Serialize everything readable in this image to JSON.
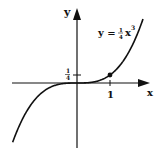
{
  "chart_data": {
    "type": "line",
    "title": "",
    "function": "y = 1/4 x^3",
    "equation_label": {
      "lhs": "y =",
      "frac_num": "1",
      "frac_den": "4",
      "var": "x",
      "exp": "3"
    },
    "xlabel": "x",
    "ylabel": "y",
    "x_tick_labels": [
      "1"
    ],
    "y_tick_labels": [
      {
        "num": "1",
        "den": "4"
      }
    ],
    "highlighted_point": {
      "x": 1,
      "y": 0.25
    },
    "series": [
      {
        "name": "y = 1/4 x^3",
        "x": [
          -2,
          -1.5,
          -1,
          -0.5,
          0,
          0.5,
          1,
          1.5,
          2
        ],
        "values": [
          -2,
          -0.84375,
          -0.25,
          -0.03125,
          0,
          0.03125,
          0.25,
          0.84375,
          2
        ]
      }
    ],
    "xlim": [
      -2.3,
      2.5
    ],
    "ylim": [
      -2.3,
      2.6
    ],
    "grid": false,
    "legend": "none",
    "colors": {
      "curve": "#111111",
      "axes": "#111111"
    }
  }
}
